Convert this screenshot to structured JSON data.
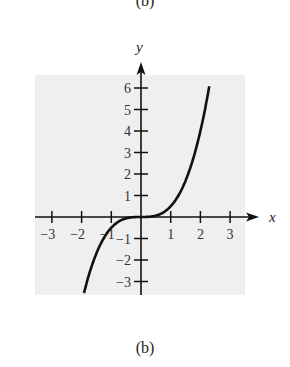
{
  "top_caption": "(b)",
  "bottom_caption": "(b)",
  "chart_data": {
    "type": "line",
    "title": "",
    "xlabel": "x",
    "ylabel": "y",
    "function": "y = x^3 / 2",
    "x_ticks": [
      -3,
      -2,
      -1,
      1,
      2,
      3
    ],
    "x_tick_labels": [
      "−3",
      "−2",
      "−1",
      "1",
      "2",
      "3"
    ],
    "y_ticks": [
      -3,
      -2,
      -1,
      1,
      2,
      3,
      4,
      5,
      6
    ],
    "y_tick_labels": [
      "−3",
      "−2",
      "−1",
      "1",
      "2",
      "3",
      "4",
      "5",
      "6"
    ],
    "xlim": [
      -3.8,
      3.8
    ],
    "ylim": [
      -3.6,
      7.0
    ],
    "grid": false,
    "background": "#efefef",
    "series": [
      {
        "name": "curve",
        "color": "#111111",
        "x": [
          -1.92,
          -1.5,
          -1.0,
          -0.5,
          0,
          0.5,
          1.0,
          1.5,
          2.0,
          2.3
        ],
        "y": [
          -3.54,
          -1.69,
          -0.5,
          -0.06,
          0,
          0.06,
          0.5,
          1.69,
          4.0,
          6.08
        ]
      }
    ]
  }
}
